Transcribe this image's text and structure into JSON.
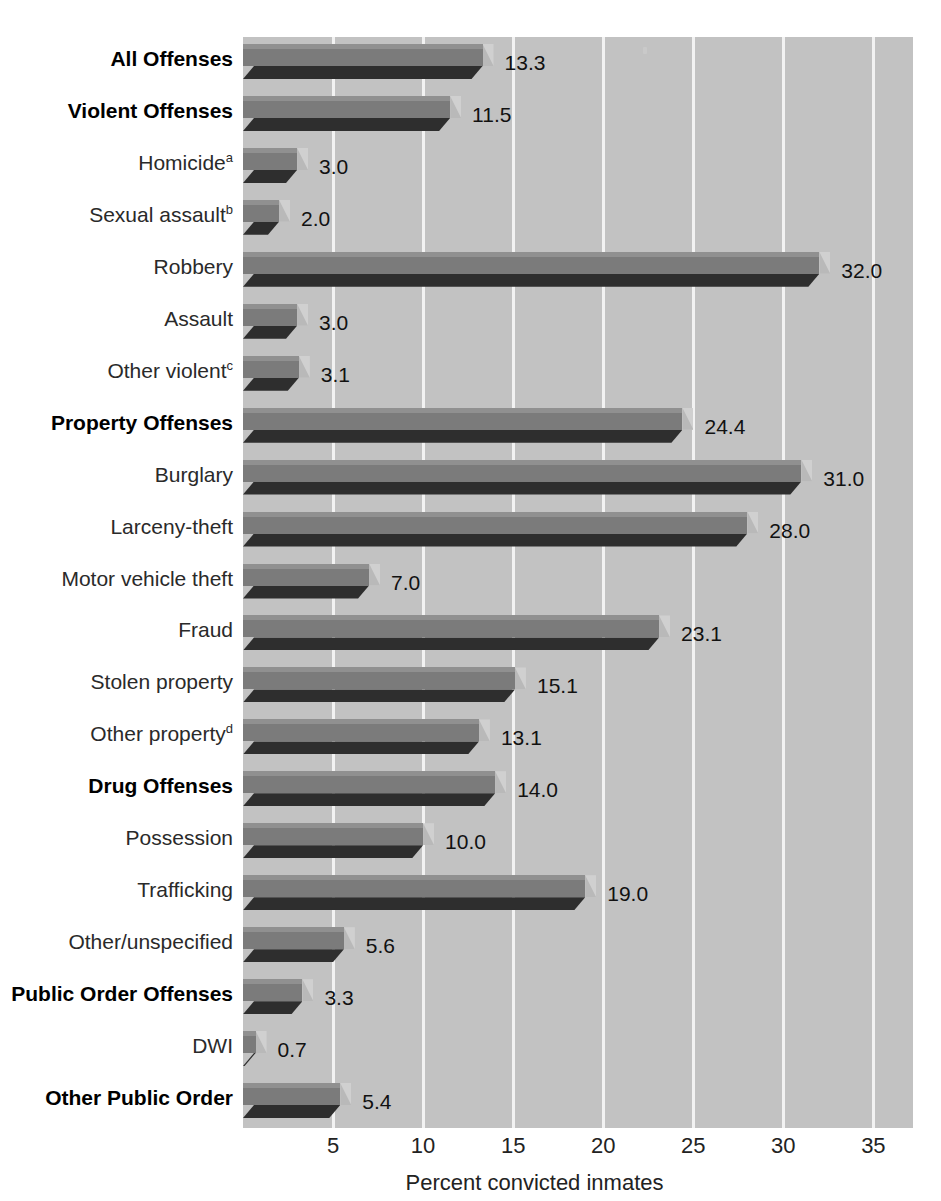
{
  "chart_data": {
    "type": "bar",
    "orientation": "horizontal",
    "title": "",
    "xlabel": "Percent convicted inmates",
    "ylabel": "",
    "xlim": [
      0,
      37.2
    ],
    "xticks": [
      5,
      10,
      15,
      20,
      25,
      30,
      35
    ],
    "grid": "vertical",
    "legend": "none",
    "value_label_format": "one-decimal",
    "categories": [
      "All Offenses",
      "Violent Offenses",
      "Homicide",
      "Sexual assault",
      "Robbery",
      "Assault",
      "Other violent",
      "Property Offenses",
      "Burglary",
      "Larceny-theft",
      "Motor vehicle theft",
      "Fraud",
      "Stolen property",
      "Other property",
      "Drug Offenses",
      "Possession",
      "Trafficking",
      "Other/unspecified",
      "Public Order Offenses",
      "DWI",
      "Other Public Order"
    ],
    "values": [
      13.3,
      11.5,
      3.0,
      2.0,
      32.0,
      3.0,
      3.1,
      24.4,
      31.0,
      28.0,
      7.0,
      23.1,
      15.1,
      13.1,
      14.0,
      10.0,
      19.0,
      5.6,
      3.3,
      0.7,
      5.4
    ],
    "footnote_markers": [
      "",
      "",
      "a",
      "b",
      "",
      "",
      "c",
      "",
      "",
      "",
      "",
      "",
      "",
      "d",
      "",
      "",
      "",
      "",
      "",
      "",
      ""
    ],
    "emphasis": [
      true,
      true,
      false,
      false,
      false,
      false,
      false,
      true,
      false,
      false,
      false,
      false,
      false,
      false,
      true,
      false,
      false,
      false,
      true,
      false,
      true
    ],
    "value_labels": [
      "13.3",
      "11.5",
      "3.0",
      "2.0",
      "32.0",
      "3.0",
      "3.1",
      "24.4",
      "31.0",
      "28.0",
      "7.0",
      "23.1",
      "15.1",
      "13.1",
      "14.0",
      "10.0",
      "19.0",
      "5.6",
      "3.3",
      "0.7",
      "5.4"
    ]
  },
  "colors": {
    "plot_background": "#c2c2c2",
    "gridline": "#f2f2f2",
    "bar_body": "#7b7b7b",
    "bar_top": "#909090",
    "bar_shadow": "#2e2e2e",
    "bar_cap": "#d0d0d0",
    "label_text": "#2a2a2a",
    "value_text": "#111111",
    "page_background": "#ffffff"
  }
}
